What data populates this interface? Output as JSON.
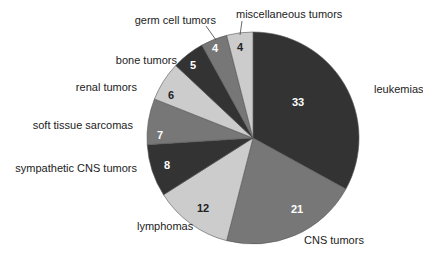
{
  "chart_data": {
    "type": "pie",
    "title": "",
    "start_angle_deg": 0,
    "direction": "clockwise",
    "total": 100,
    "slices": [
      {
        "label": "leukemias",
        "value": 33,
        "color": "#333333",
        "text_color": "#ffffff"
      },
      {
        "label": "CNS tumors",
        "value": 21,
        "color": "#777777",
        "text_color": "#ffffff"
      },
      {
        "label": "lymphomas",
        "value": 12,
        "color": "#cccccc",
        "text_color": "#222222"
      },
      {
        "label": "sympathetic CNS tumors",
        "value": 8,
        "color": "#333333",
        "text_color": "#ffffff"
      },
      {
        "label": "soft tissue sarcomas",
        "value": 7,
        "color": "#777777",
        "text_color": "#ffffff"
      },
      {
        "label": "renal tumors",
        "value": 6,
        "color": "#cccccc",
        "text_color": "#222222"
      },
      {
        "label": "bone tumors",
        "value": 5,
        "color": "#333333",
        "text_color": "#ffffff"
      },
      {
        "label": "germ cell tumors",
        "value": 4,
        "color": "#777777",
        "text_color": "#ffffff"
      },
      {
        "label": "miscellaneous tumors",
        "value": 4,
        "color": "#cccccc",
        "text_color": "#222222"
      }
    ],
    "legend": "none (outside labels)"
  },
  "layout": {
    "cx": 253,
    "cy": 138,
    "r": 106,
    "labels": [
      {
        "x": 374,
        "y": 93,
        "anchor": "start",
        "vx": 298,
        "vy": 106
      },
      {
        "x": 304,
        "y": 244,
        "anchor": "start",
        "vx": 297,
        "vy": 213
      },
      {
        "x": 137,
        "y": 230,
        "anchor": "start",
        "vx": 203,
        "vy": 212
      },
      {
        "x": 137,
        "y": 172,
        "anchor": "end",
        "vx": 167,
        "vy": 169
      },
      {
        "x": 133,
        "y": 129,
        "anchor": "end",
        "vx": 160,
        "vy": 139
      },
      {
        "x": 137,
        "y": 91,
        "anchor": "end",
        "vx": 171,
        "vy": 99
      },
      {
        "x": 177,
        "y": 64,
        "anchor": "end",
        "vx": 193,
        "vy": 69
      },
      {
        "x": 216,
        "y": 24,
        "anchor": "end",
        "vx": 215,
        "vy": 52
      },
      {
        "x": 236,
        "y": 18,
        "anchor": "start",
        "vx": 240,
        "vy": 51
      }
    ],
    "leaders": [
      null,
      null,
      null,
      null,
      null,
      null,
      null,
      {
        "x1": 206,
        "y1": 26,
        "x2": 216,
        "y2": 40
      },
      {
        "x1": 242,
        "y1": 21,
        "x2": 240,
        "y2": 35
      }
    ]
  }
}
